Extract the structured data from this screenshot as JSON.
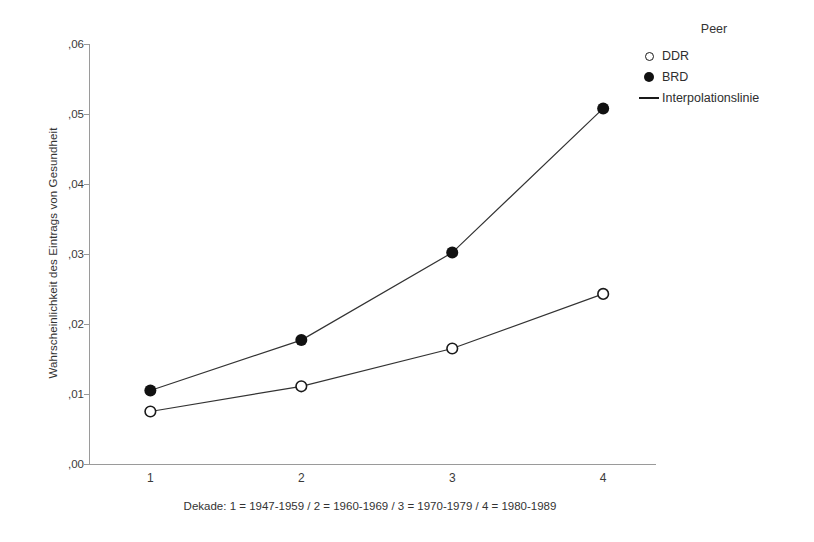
{
  "chart_data": {
    "type": "line",
    "title": "",
    "xlabel": "Dekade: 1 = 1947-1959 / 2 = 1960-1969 / 3 = 1970-1979 / 4 = 1980-1989",
    "ylabel": "Wahrscheinlichkeit des Eintrags von Gesundheit",
    "categories": [
      "1",
      "2",
      "3",
      "4"
    ],
    "x": [
      1,
      2,
      3,
      4
    ],
    "xlim": [
      0.6,
      4.35
    ],
    "ylim": [
      0.0,
      0.06
    ],
    "grid": false,
    "legend_position": "right",
    "legend_title": "Peer",
    "series": [
      {
        "name": "DDR",
        "marker": "open-circle",
        "values": [
          0.0075,
          0.0111,
          0.0165,
          0.0243
        ]
      },
      {
        "name": "BRD",
        "marker": "filled-circle",
        "values": [
          0.0105,
          0.0177,
          0.0302,
          0.0508
        ]
      }
    ],
    "line_legend_label": "Interpolationslinie",
    "ytick_labels": [
      ",00",
      ",01",
      ",02",
      ",03",
      ",04",
      ",05",
      ",06"
    ],
    "ytick_values": [
      0.0,
      0.01,
      0.02,
      0.03,
      0.04,
      0.05,
      0.06
    ],
    "xtick_labels": [
      "1",
      "2",
      "3",
      "4"
    ],
    "colors": {
      "axis": "#9a9a9a",
      "line": "#333333",
      "marker_fill": "#111111",
      "marker_open_edge": "#1a1a1a",
      "background": "#ffffff",
      "text": "#333333"
    }
  },
  "legend": {
    "title": "Peer",
    "entries": [
      {
        "label": "DDR",
        "marker": "open-circle"
      },
      {
        "label": "BRD",
        "marker": "filled-circle"
      },
      {
        "label": "Interpolationslinie",
        "marker": "line"
      }
    ]
  },
  "axes": {
    "y_title": "Wahrscheinlichkeit des Eintrags von Gesundheit",
    "x_caption": "Dekade: 1 = 1947-1959 / 2 = 1960-1969 / 3 = 1970-1979 / 4 = 1980-1989"
  }
}
